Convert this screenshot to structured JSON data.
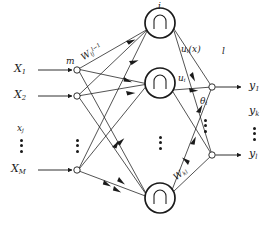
{
  "figure": {
    "type": "neural-network-diagram",
    "background_color": "#ffffff",
    "stroke_color": "#1a1a1a"
  },
  "inputs": {
    "label_x1": "X",
    "label_x1_sub": "1",
    "label_x2": "X",
    "label_x2_sub": "2",
    "label_xj": "x",
    "label_xj_sub": "j",
    "label_xm": "X",
    "label_xm_sub": "M",
    "node_label_m": "m",
    "vertical_dots": "⋮"
  },
  "weights": {
    "input_to_hidden": "W",
    "input_to_hidden_sub": "ij",
    "input_to_hidden_sup": "l−1",
    "hidden_to_output": "W",
    "hidden_to_output_sub": "kl"
  },
  "hidden": {
    "node_symbol": "∩",
    "top_node_label": "i",
    "mid_node_label": "u",
    "mid_node_label_sub": "i",
    "activation_label": "u",
    "activation_label_sub": "i",
    "activation_label_arg": "(x)",
    "vertical_dots": "⋮"
  },
  "output": {
    "layer_label": "l",
    "theta_label": "θ",
    "theta_label_sub": "i",
    "label_y1": "y",
    "label_y1_sub": "1",
    "label_yk": "y",
    "label_yk_sub": "k",
    "label_yl": "y",
    "label_yl_sub": "l",
    "vertical_dots": "⋮"
  }
}
